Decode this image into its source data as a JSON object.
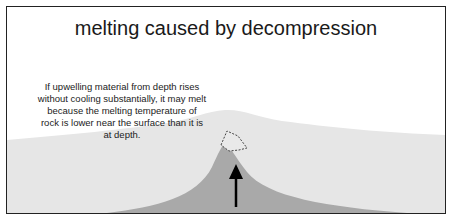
{
  "diagram": {
    "title": "melting caused by decompression",
    "caption": "If upwelling material from depth rises without cooling substantially, it may melt because the melting temperature of rock is lower near the surface than it is at depth.",
    "colors": {
      "crust": "#e6e6e6",
      "mantle_plume": "#a9a9a9",
      "border": "#222222",
      "arrow": "#000000",
      "melt_outline": "#444444"
    },
    "elements": [
      {
        "name": "crust-layer",
        "description": "light gray surface layer with central bulge"
      },
      {
        "name": "upwelling-plume",
        "description": "darker gray cone of rising mantle material"
      },
      {
        "name": "melt-pocket",
        "description": "dashed outline region at plume top"
      },
      {
        "name": "upward-arrow",
        "description": "black arrow indicating upward motion"
      }
    ]
  }
}
